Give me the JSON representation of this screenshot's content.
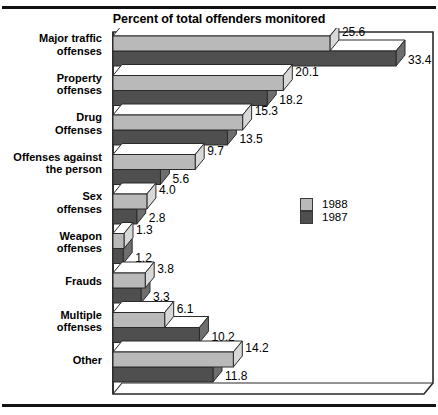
{
  "page": {
    "top_caption": "",
    "title": "Percent of total offenders monitored"
  },
  "legend": {
    "position": "inside-right",
    "items": [
      {
        "label": "1988",
        "color": "#b9b9b9",
        "swatch_name": "legend-swatch-1988"
      },
      {
        "label": "1987",
        "color": "#4f4f4f",
        "swatch_name": "legend-swatch-1987"
      }
    ]
  },
  "chart_data": {
    "type": "bar",
    "orientation": "horizontal",
    "style": "3d",
    "title": "Percent of total offenders monitored",
    "xlabel": "",
    "ylabel": "",
    "xlim": [
      0,
      33.4
    ],
    "grid": false,
    "legend_position": "inside-right",
    "categories": [
      "Major traffic offenses",
      "Property offenses",
      "Drug Offenses",
      "Offenses against the person",
      "Sex offenses",
      "Weapon offenses",
      "Frauds",
      "Multiple offenses",
      "Other"
    ],
    "category_lines": [
      [
        "Major traffic",
        "offenses"
      ],
      [
        "Property",
        "offenses"
      ],
      [
        "Drug",
        "Offenses"
      ],
      [
        "Offenses against",
        "the person"
      ],
      [
        "Sex",
        "offenses"
      ],
      [
        "Weapon",
        "offenses"
      ],
      [
        "Frauds"
      ],
      [
        "Multiple",
        "offenses"
      ],
      [
        "Other"
      ]
    ],
    "series": [
      {
        "name": "1988",
        "color": "#b9b9b9",
        "values": [
          25.6,
          20.1,
          15.3,
          9.7,
          4.0,
          1.3,
          3.8,
          6.1,
          14.2
        ],
        "labels": [
          "25.6",
          "20.1",
          "15.3",
          "9.7",
          "4.0",
          "1.3",
          "3.8",
          "6.1",
          "14.2"
        ]
      },
      {
        "name": "1987",
        "color": "#4f4f4f",
        "values": [
          33.4,
          18.2,
          13.5,
          5.6,
          2.8,
          1.2,
          3.3,
          10.2,
          11.8
        ],
        "labels": [
          "33.4",
          "18.2",
          "13.5",
          "5.6",
          "2.8",
          "1.2",
          "3.3",
          "10.2",
          "11.8"
        ]
      }
    ]
  }
}
